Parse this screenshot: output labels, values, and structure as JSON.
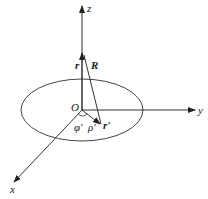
{
  "diagram": {
    "type": "3d-coordinate-system",
    "axes": {
      "x": {
        "label": "x"
      },
      "y": {
        "label": "y"
      },
      "z": {
        "label": "z"
      }
    },
    "origin_label": "O",
    "vectors": {
      "r": {
        "label": "r"
      },
      "R": {
        "label": "R"
      },
      "r_prime": {
        "label": "r'"
      }
    },
    "angles": {
      "phi_prime": {
        "label": "φ'"
      },
      "rho_prime": {
        "label": "ρ'"
      }
    },
    "shape": "disk (ellipse in xy-plane)",
    "colors": {
      "line": "#333333",
      "background": "#ffffff"
    }
  }
}
